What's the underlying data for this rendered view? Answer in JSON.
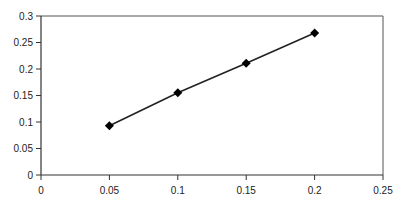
{
  "chart_data": {
    "type": "line",
    "title": "",
    "xlabel": "",
    "ylabel": "",
    "x": [
      0.05,
      0.1,
      0.15,
      0.2
    ],
    "series": [
      {
        "name": "series-1",
        "values": [
          0.093,
          0.155,
          0.211,
          0.268
        ],
        "marker": "diamond",
        "color": "#111111"
      }
    ],
    "xlim": [
      0,
      0.25
    ],
    "ylim": [
      0,
      0.3
    ],
    "xticks": [
      0,
      0.05,
      0.1,
      0.15,
      0.2,
      0.25
    ],
    "xtick_labels": [
      "0",
      "0.05",
      "0.1",
      "0.15",
      "0.2",
      "0.25"
    ],
    "yticks": [
      0,
      0.05,
      0.1,
      0.15,
      0.2,
      0.25,
      0.3
    ],
    "ytick_labels": [
      "0",
      "0.05",
      "0.1",
      "0.15",
      "0.2",
      "0.25",
      "0.3"
    ],
    "grid": false,
    "legend": "none",
    "frame": "box"
  },
  "colors": {
    "axis": "#333333",
    "frame": "#555555",
    "line": "#222222",
    "marker": "#000000"
  }
}
